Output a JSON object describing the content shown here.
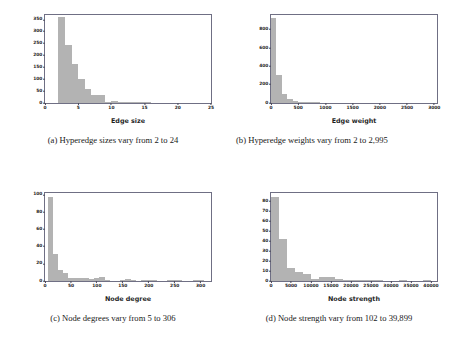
{
  "figure": {
    "subfigures": [
      {
        "tag": "(a)",
        "caption": "(a) Hyperedge sizes vary from 2 to 24",
        "caption_lines": [
          "(a) Hyperedge sizes vary from 2 to 24"
        ],
        "xlabel": "Edge size",
        "ylabel": ""
      },
      {
        "tag": "(b)",
        "caption": "(b) Hyperedge weights vary from 2 to 2,995",
        "caption_lines": [
          "(b) Hyperedge weights vary from 2 to",
          "2,995"
        ],
        "xlabel": "Edge weight",
        "ylabel": ""
      },
      {
        "tag": "(c)",
        "caption": "(c) Node degrees vary from 5 to 306",
        "caption_lines": [
          "(c) Node degrees vary from 5 to 306"
        ],
        "xlabel": "Node degree",
        "ylabel": ""
      },
      {
        "tag": "(d)",
        "caption": "(d) Node strength vary from 102 to 39,899",
        "caption_lines": [
          "(d) Node strength vary from 102 to 39,899"
        ],
        "xlabel": "Node strength",
        "ylabel": ""
      }
    ]
  },
  "style": {
    "bar_color": "#b3b3b3",
    "axes_color": "#6f6f84",
    "text_color": "#262626",
    "background": "#ffffff"
  },
  "chart_data": [
    {
      "type": "bar",
      "id": "edge-size-histogram",
      "title": "",
      "xlabel": "Edge size",
      "ylabel": "",
      "xlim": [
        0,
        25
      ],
      "ylim": [
        0,
        370
      ],
      "xticks": [
        0,
        5,
        10,
        15,
        20,
        25
      ],
      "xticklabels": [
        "0",
        "5",
        "10",
        "15",
        "20",
        "25"
      ],
      "yticks": [
        0,
        50,
        100,
        150,
        200,
        250,
        300,
        350
      ],
      "yticklabels": [
        "0",
        "50",
        "100",
        "150",
        "200",
        "250",
        "300",
        "350"
      ],
      "grid": false,
      "legend": null,
      "bin_edges": [
        2,
        3,
        4,
        5,
        6,
        7,
        8,
        9,
        10,
        11,
        12,
        13,
        14,
        15,
        16
      ],
      "values": [
        363,
        243,
        163,
        100,
        57,
        35,
        33,
        2,
        8,
        6,
        4,
        3,
        3,
        2
      ]
    },
    {
      "type": "bar",
      "id": "edge-weight-histogram",
      "title": "",
      "xlabel": "Edge weight",
      "ylabel": "",
      "xlim": [
        0,
        3050
      ],
      "ylim": [
        0,
        960
      ],
      "xticks": [
        0,
        500,
        1000,
        1500,
        2000,
        2500,
        3000
      ],
      "xticklabels": [
        "0",
        "500",
        "1000",
        "1500",
        "2000",
        "2500",
        "3000"
      ],
      "yticks": [
        0,
        200,
        400,
        600,
        800
      ],
      "yticklabels": [
        "0",
        "200",
        "400",
        "600",
        "800"
      ],
      "grid": false,
      "legend": null,
      "bin_edges": [
        0,
        100,
        200,
        300,
        400,
        500,
        600,
        700,
        800,
        900
      ],
      "values": [
        930,
        305,
        100,
        40,
        20,
        12,
        8,
        4,
        2
      ]
    },
    {
      "type": "bar",
      "id": "node-degree-histogram",
      "title": "",
      "xlabel": "Node degree",
      "ylabel": "",
      "xlim": [
        0,
        320
      ],
      "ylim": [
        0,
        102
      ],
      "xticks": [
        0,
        50,
        100,
        150,
        200,
        250,
        300
      ],
      "xticklabels": [
        "0",
        "50",
        "100",
        "150",
        "200",
        "250",
        "300"
      ],
      "yticks": [
        0,
        20,
        40,
        60,
        80,
        100
      ],
      "yticklabels": [
        "0",
        "20",
        "40",
        "60",
        "80",
        "100"
      ],
      "grid": false,
      "legend": null,
      "bin_edges": [
        5,
        15,
        25,
        35,
        45,
        55,
        65,
        75,
        85,
        95,
        105,
        115,
        125,
        135,
        145,
        155,
        165,
        175,
        185,
        195,
        205,
        215,
        225,
        235,
        245,
        255,
        265,
        275,
        285,
        295,
        306
      ],
      "values": [
        97,
        31,
        13,
        9,
        3,
        4,
        4,
        4,
        2,
        4,
        5,
        1,
        0,
        0,
        1,
        2,
        1,
        0,
        1,
        1,
        1,
        0,
        0,
        1,
        1,
        1,
        0,
        0,
        1,
        1
      ]
    },
    {
      "type": "bar",
      "id": "node-strength-histogram",
      "title": "",
      "xlabel": "Node strength",
      "ylabel": "",
      "xlim": [
        0,
        41500
      ],
      "ylim": [
        0,
        88
      ],
      "xticks": [
        0,
        5000,
        10000,
        15000,
        20000,
        25000,
        30000,
        35000,
        40000
      ],
      "xticklabels": [
        "0",
        "5000",
        "10000",
        "15000",
        "20000",
        "25000",
        "30000",
        "35000",
        "40000"
      ],
      "yticks": [
        0,
        10,
        20,
        30,
        40,
        50,
        60,
        70,
        80
      ],
      "yticklabels": [
        "0",
        "10",
        "20",
        "30",
        "40",
        "50",
        "60",
        "70",
        "80"
      ],
      "grid": false,
      "legend": null,
      "bin_edges": [
        102,
        2000,
        4000,
        6000,
        8000,
        10000,
        12000,
        14000,
        16000,
        18000,
        20000,
        22000,
        24000,
        26000,
        28000,
        30000,
        32000,
        34000,
        36000,
        38000,
        40000
      ],
      "values": [
        84,
        42,
        13,
        9,
        7,
        2,
        4,
        4,
        2,
        1,
        1,
        1,
        1,
        1,
        0,
        0,
        1,
        0,
        0,
        1
      ]
    }
  ]
}
